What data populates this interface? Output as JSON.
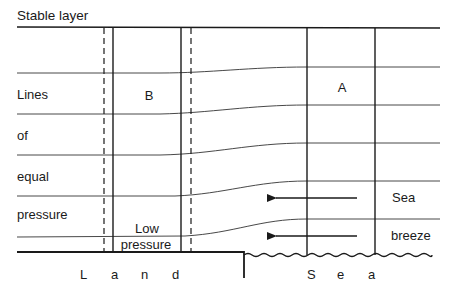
{
  "title": "Stable layer",
  "isobar_labels": [
    "Lines",
    "of",
    "equal",
    "pressure"
  ],
  "column_labels": {
    "land_column": "B",
    "sea_column": "A"
  },
  "low_pressure_label": [
    "Low",
    "pressure"
  ],
  "breeze_labels": [
    "Sea",
    "breeze"
  ],
  "surface_labels": {
    "land": [
      "L",
      "a",
      "n",
      "d"
    ],
    "sea": [
      "S",
      "e",
      "a"
    ]
  },
  "colors": {
    "line": "#1a1a1a",
    "background": "#ffffff"
  }
}
